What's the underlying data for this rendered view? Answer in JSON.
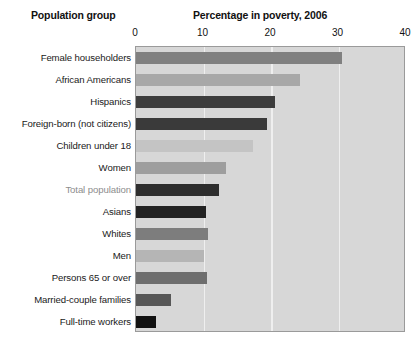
{
  "headings": {
    "group": "Population group",
    "value": "Percentage in poverty, 2006"
  },
  "chart_data": {
    "type": "bar",
    "orientation": "horizontal",
    "title": "Percentage in poverty, 2006",
    "xlabel": "Percentage in poverty, 2006",
    "ylabel": "Population group",
    "xlim": [
      0,
      40
    ],
    "xticks": [
      0,
      10,
      20,
      30,
      40
    ],
    "tick_labels": [
      "0",
      "10",
      "20",
      "30",
      "40"
    ],
    "grid": true,
    "grid_axis": "x",
    "legend": "none",
    "plot_background": "#d7d7d7",
    "categories": [
      "Female householders",
      "African Americans",
      "Hispanics",
      "Foreign-born (not citizens)",
      "Children under 18",
      "Women",
      "Total population",
      "Asians",
      "Whites",
      "Men",
      "Persons 65 or over",
      "Married-couple families",
      "Full-time workers"
    ],
    "values": [
      30.5,
      24.3,
      20.6,
      19.4,
      17.4,
      13.3,
      12.3,
      10.3,
      10.7,
      10.1,
      10.5,
      5.2,
      2.9
    ],
    "bar_colors": [
      "#808080",
      "#a8a8a8",
      "#3d3d3d",
      "#3a3a3a",
      "#c4c4c4",
      "#9e9e9e",
      "#2e2e2e",
      "#232323",
      "#7d7d7d",
      "#b5b5b5",
      "#6e6e6e",
      "#575757",
      "#111111"
    ],
    "highlighted_category": "Total population",
    "highlight_label_color": "#8d8d8d"
  }
}
